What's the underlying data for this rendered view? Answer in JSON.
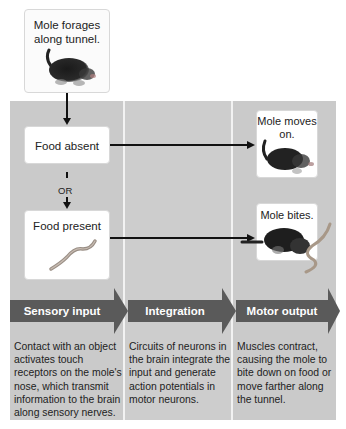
{
  "diagram": {
    "start": {
      "label": "Mole forages along tunnel.",
      "icon": "mole-icon"
    },
    "branch_absent": {
      "label": "Food absent"
    },
    "branch_connector": {
      "label": "OR"
    },
    "branch_present": {
      "label": "Food present",
      "icon": "worm-icon"
    },
    "outcome_absent": {
      "label": "Mole moves on.",
      "icon": "mole-icon"
    },
    "outcome_present": {
      "label": "Mole bites.",
      "icon": "mole-biting-worm-icon"
    }
  },
  "stages": [
    {
      "label": "Sensory input",
      "description": "Contact with an object activates touch receptors on the mole's nose, which transmit information to the brain along sensory nerves."
    },
    {
      "label": "Integration",
      "description": "Circuits of neurons in the brain integrate the input and generate action potentials in motor neurons."
    },
    {
      "label": "Motor output",
      "description": "Muscles contract, causing the mole to bite down on food or move farther along the tunnel."
    }
  ],
  "colors": {
    "panel_gray": "#cacaca",
    "band_dark": "#5a5a5a",
    "box_white": "#ffffff",
    "arrow_black": "#111111"
  }
}
